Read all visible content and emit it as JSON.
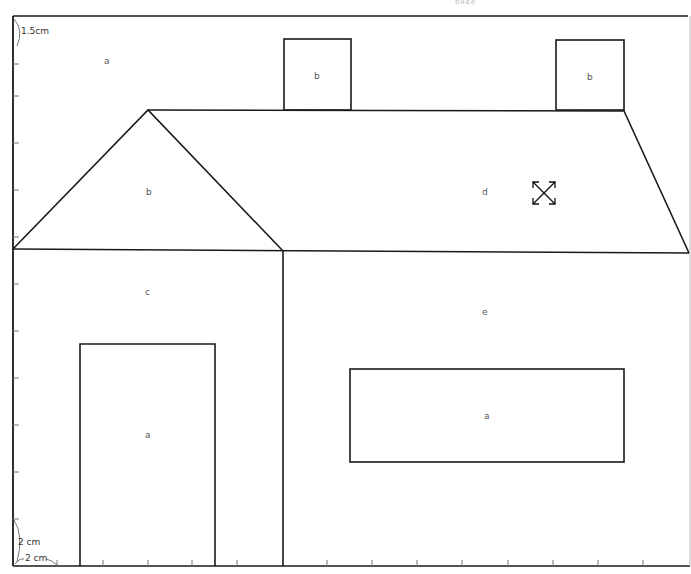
{
  "header": {
    "cutoff_text": "page"
  },
  "dimensions": {
    "vertical_unit": "1.5cm",
    "corner_vertical": "2 cm",
    "corner_horizontal": "2 cm"
  },
  "regions": {
    "sky": "a",
    "chimney_left": "b",
    "chimney_right": "b",
    "gable": "b",
    "roof": "d",
    "gable_wall": "c",
    "main_wall": "e",
    "door": "a",
    "window": "a"
  },
  "cursor": {
    "icon": "move-resize-icon"
  },
  "colors": {
    "line": "#1a1a1a",
    "label": "#555555",
    "background": "#ffffff"
  },
  "rulers": {
    "left_ticks_y": [
      96,
      143,
      190,
      237,
      284,
      331,
      378,
      425,
      472,
      519
    ],
    "bottom_ticks_x": [
      57,
      103,
      148,
      192,
      237,
      327,
      372,
      417,
      462,
      508,
      553,
      598,
      643
    ]
  }
}
